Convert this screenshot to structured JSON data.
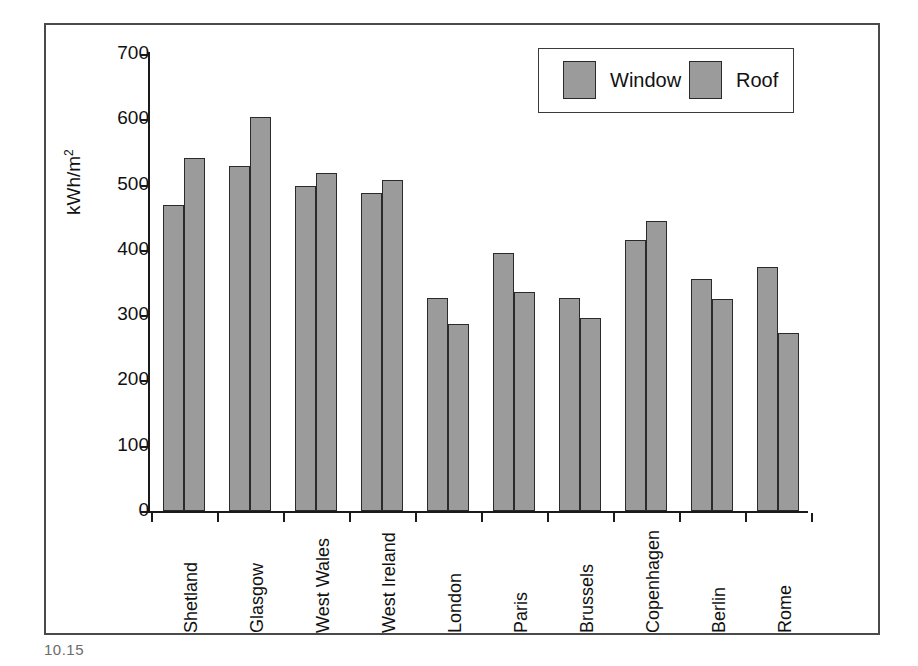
{
  "figure": {
    "caption": "10.15"
  },
  "legend": {
    "entries": [
      {
        "label": "Window",
        "color": "#9b9b9b"
      },
      {
        "label": "Roof",
        "color": "#9b9b9b"
      }
    ]
  },
  "axes": {
    "y_title": "kWh/m",
    "y_title_exponent": "2",
    "y_ticks": [
      "0",
      "100",
      "200",
      "300",
      "400",
      "500",
      "600",
      "700"
    ]
  },
  "chart_data": {
    "type": "bar",
    "title": "",
    "xlabel": "",
    "ylabel": "kWh/m2",
    "ylim": [
      0,
      700
    ],
    "ytick_step": 100,
    "grid": false,
    "legend_position": "top-right",
    "categories": [
      "Shetland",
      "Glasgow",
      "West Wales",
      "West Ireland",
      "London",
      "Paris",
      "Brussels",
      "Copenhagen",
      "Berlin",
      "Rome"
    ],
    "series": [
      {
        "name": "Window",
        "color": "#9b9b9b",
        "values": [
          468,
          528,
          498,
          487,
          327,
          395,
          326,
          415,
          355,
          374
        ]
      },
      {
        "name": "Roof",
        "color": "#9b9b9b",
        "values": [
          540,
          604,
          517,
          507,
          287,
          335,
          295,
          444,
          324,
          273
        ]
      }
    ]
  }
}
